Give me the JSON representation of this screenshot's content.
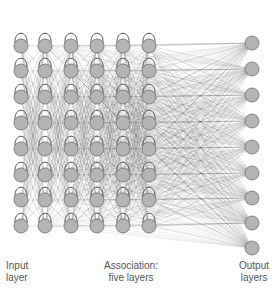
{
  "diagram": {
    "type": "neural-network",
    "title": "",
    "input_layer": {
      "label_line1": "Input",
      "label_line2": "layer",
      "nodes": 8
    },
    "association_layers": {
      "label_line1": "Association:",
      "label_line2": "five layers",
      "layers": 5,
      "nodes_per_layer": 8
    },
    "output_layer": {
      "label_line1": "Output",
      "label_line2": "layers",
      "nodes": 9
    },
    "colors": {
      "node_fill": "#b4b4b4",
      "node_stroke": "#6e6e6e",
      "edge": "#555555",
      "text": "#555555"
    },
    "layout": {
      "column_x": [
        21,
        45,
        71,
        97,
        123,
        149
      ],
      "row_y": [
        46,
        71,
        97,
        123,
        149,
        175,
        200,
        226
      ],
      "output_x": 252,
      "output_y": [
        43,
        69,
        95,
        121,
        147,
        173,
        198,
        223,
        248
      ],
      "node_radius": 7
    }
  }
}
